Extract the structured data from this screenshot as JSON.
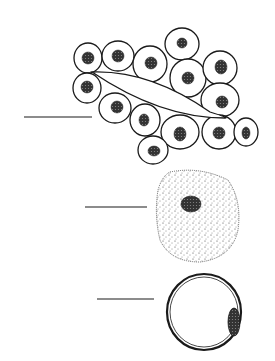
{
  "figure": {
    "label_lines": [
      {
        "x1": 24,
        "y1": 117,
        "x2": 92,
        "y2": 117
      },
      {
        "x1": 85,
        "y1": 207,
        "x2": 147,
        "y2": 207
      },
      {
        "x1": 97,
        "y1": 299,
        "x2": 154,
        "y2": 299
      }
    ],
    "colors": {
      "ink": "#1a1a1a",
      "background": "#ffffff"
    }
  }
}
